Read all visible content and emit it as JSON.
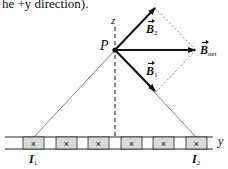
{
  "header_text": "he +y direction).",
  "diagram": {
    "axis_labels": {
      "z": "z",
      "y": "y"
    },
    "point_label": "P",
    "vectors": [
      {
        "name": "B2",
        "base": "B",
        "sub": "2",
        "direction": "up-right"
      },
      {
        "name": "Bnet",
        "base": "B",
        "sub": "net",
        "direction": "right (+y)"
      },
      {
        "name": "B1",
        "base": "B",
        "sub": "1",
        "direction": "down-right"
      }
    ],
    "currents": [
      {
        "name": "I1",
        "base": "I",
        "sub": "1"
      },
      {
        "name": "I2",
        "base": "I",
        "sub": "2"
      }
    ],
    "wire_symbol": "×",
    "wire_count": 6
  },
  "colors": {
    "ink": "#111111",
    "box_fill": "#d9d9d9",
    "background": "#ffffff"
  }
}
